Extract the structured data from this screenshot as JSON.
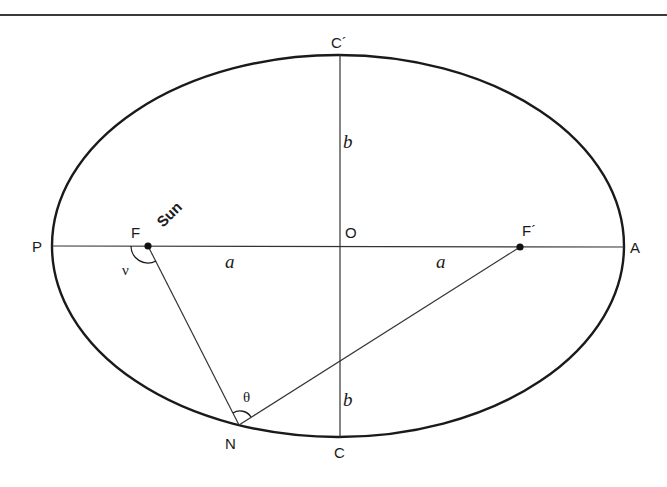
{
  "diagram": {
    "colors": {
      "stroke": "#1a1a1a",
      "rule": "#3a3a3a",
      "background": "#ffffff"
    },
    "ellipse": {
      "cx": 338,
      "cy": 246,
      "rx": 286,
      "ry": 191
    },
    "points": {
      "P": {
        "label": "P",
        "x": 52,
        "y": 246
      },
      "A": {
        "label": "A",
        "x": 624,
        "y": 246
      },
      "O": {
        "label": "O",
        "x": 340,
        "y": 246
      },
      "F": {
        "label": "F",
        "x": 148,
        "y": 246
      },
      "F_prime": {
        "label": "F´",
        "x": 520,
        "y": 247
      },
      "C": {
        "label": "C",
        "x": 340,
        "y": 437
      },
      "C_prime": {
        "label": "C´",
        "x": 340,
        "y": 55
      },
      "N": {
        "label": "N",
        "x": 239,
        "y": 425
      }
    },
    "labels": {
      "sun": "Sun",
      "a_left": "a",
      "a_right": "a",
      "b_top": "b",
      "b_bottom": "b",
      "nu": "ν",
      "theta": "θ"
    }
  }
}
